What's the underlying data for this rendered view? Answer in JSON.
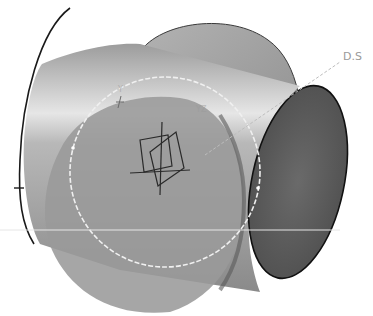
{
  "scene": {
    "description": "3D CAD view: cylinder intersecting a disc, with sketch-plane compass and dashed direction line",
    "background": "#ffffff",
    "colors": {
      "cylinder_light": "#bdbdbd",
      "cylinder_highlight": "#e8e8e8",
      "cylinder_dark": "#8c8c8c",
      "disc": "#a8a8a8",
      "disc_shadow": "#7a7a7a",
      "end_cap": "#5e5e5e",
      "outline": "#1a1a1a",
      "construction_line": "#f2f2f2",
      "direction_line": "#b0b0b0",
      "label_color": "#9a9a9a"
    }
  },
  "labels": {
    "direction_label": "D.S",
    "axis_y": "Y",
    "axis_x": "X",
    "plane_label": "YZ"
  }
}
